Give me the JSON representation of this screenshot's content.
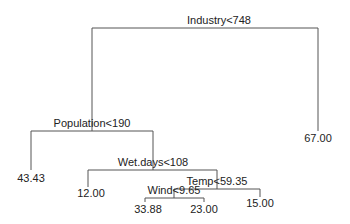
{
  "diagram": {
    "type": "regression-tree",
    "colors": {
      "line": "#555555",
      "text": "#222222",
      "background": "#ffffff"
    },
    "splits": [
      {
        "id": "root",
        "label": "Industry<748"
      },
      {
        "id": "n_pop",
        "label": "Population<190"
      },
      {
        "id": "n_wet",
        "label": "Wet.days<108"
      },
      {
        "id": "n_temp",
        "label": "Temp<59.35"
      },
      {
        "id": "n_wind",
        "label": "Wind<9.65"
      }
    ],
    "leaves": [
      {
        "id": "leaf_43",
        "value": "43.43"
      },
      {
        "id": "leaf_12",
        "value": "12.00"
      },
      {
        "id": "leaf_3388",
        "value": "33.88"
      },
      {
        "id": "leaf_23",
        "value": "23.00"
      },
      {
        "id": "leaf_15",
        "value": "15.00"
      },
      {
        "id": "leaf_67",
        "value": "67.00"
      }
    ]
  }
}
